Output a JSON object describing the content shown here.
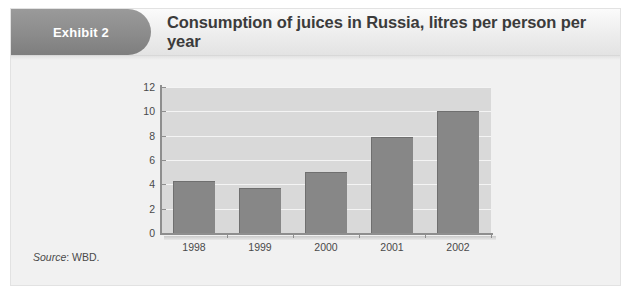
{
  "card": {
    "badge_label": "Exhibit 2",
    "title": "Consumption of juices in Russia, litres per person per year",
    "source_prefix": "Source",
    "source_text": ": WBD."
  },
  "colors": {
    "badge": "#8d8d8d",
    "bar": "#878787",
    "plot_background": "#d9d9d9",
    "gridline": "#f4f4f4",
    "card_background": "#f1f1f1",
    "title_text": "#3b3b3b"
  },
  "chart_data": {
    "type": "bar",
    "title": "Consumption of juices in Russia, litres per person per year",
    "xlabel": "",
    "ylabel": "",
    "categories": [
      "1998",
      "1999",
      "2000",
      "2001",
      "2002"
    ],
    "values": [
      4.3,
      3.7,
      5.0,
      7.9,
      10.0
    ],
    "ylim": [
      0,
      12
    ],
    "yticks": [
      0,
      2,
      4,
      6,
      8,
      10,
      12
    ],
    "ytick_labels": [
      "0",
      "2",
      "4",
      "6",
      "8",
      "10",
      "12"
    ],
    "grid": true,
    "legend": false,
    "legend_position": "none",
    "series": [
      {
        "name": "Litres per person per year",
        "values": [
          4.3,
          3.7,
          5.0,
          7.9,
          10.0
        ]
      }
    ],
    "source": "Source: WBD."
  }
}
